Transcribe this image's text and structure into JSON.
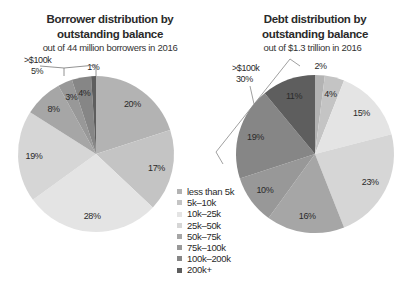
{
  "chart_data": [
    {
      "type": "pie",
      "title": "Borrower distribution by outstanding balance",
      "subtitle": "out of 44 million borrowers in 2016",
      "categories": [
        "less than 5k",
        "5k–10k",
        "10k–25k",
        "25k–50k",
        "50k–75k",
        "75k–100k",
        "100k–200k",
        "200k+"
      ],
      "values": [
        20,
        17,
        28,
        19,
        8,
        3,
        4,
        1
      ],
      "labels": [
        "20%",
        "17%",
        "28%",
        "19%",
        "8%",
        "3%",
        "4%",
        "1%"
      ],
      "annotation": {
        "text_line1": ">$100k",
        "text_line2": "5%"
      }
    },
    {
      "type": "pie",
      "title": "Debt distribution by outstanding balance",
      "subtitle": "out of $1.3 trillion in 2016",
      "categories": [
        "less than 5k",
        "5k–10k",
        "10k–25k",
        "25k–50k",
        "50k–75k",
        "75k–100k",
        "100k–200k",
        "200k+"
      ],
      "values": [
        2,
        4,
        15,
        23,
        16,
        10,
        19,
        11
      ],
      "labels": [
        "2%",
        "4%",
        "15%",
        "23%",
        "16%",
        "10%",
        "19%",
        "11%"
      ],
      "annotation": {
        "text_line1": ">$100k",
        "text_line2": "30%"
      }
    }
  ],
  "charts": {
    "left": {
      "title_line1": "Borrower distribution by",
      "title_line2": "outstanding balance",
      "subtitle": "out of  44 million borrowers in 2016",
      "annotation_line1": ">$100k",
      "annotation_line2": "5%"
    },
    "right": {
      "title_line1": "Debt distribution by",
      "title_line2": "outstanding balance",
      "subtitle": "out of $1.3 trillion in 2016",
      "annotation_line1": ">$100k",
      "annotation_line2": "30%"
    }
  },
  "legend": {
    "items": [
      {
        "label": "less than 5k",
        "color": "#b3b3b3"
      },
      {
        "label": "5k–10k",
        "color": "#c4c4c4"
      },
      {
        "label": "10k–25k",
        "color": "#e4e4e4"
      },
      {
        "label": "25k–50k",
        "color": "#d6d6d6"
      },
      {
        "label": "50k–75k",
        "color": "#a6a6a6"
      },
      {
        "label": "75k–100k",
        "color": "#989898"
      },
      {
        "label": "100k–200k",
        "color": "#868686"
      },
      {
        "label": "200k+",
        "color": "#5e5e5e"
      }
    ]
  }
}
